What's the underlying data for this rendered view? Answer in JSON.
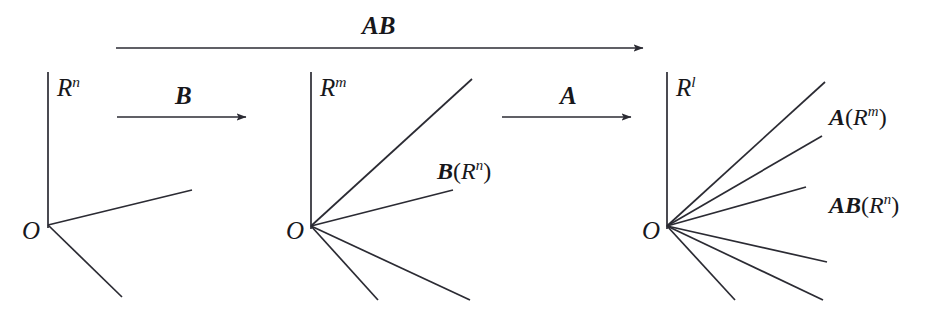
{
  "figure": {
    "background_color": "#ffffff",
    "stroke_color": "#2b2b33",
    "text_color": "#17171b"
  },
  "top_arrow": {
    "label_text": "AB",
    "label_parts": {
      "bold_italic": "AB"
    },
    "from_x": 116,
    "to_x": 645,
    "y": 48
  },
  "arrows": [
    {
      "name": "arrow-B",
      "label_text": "B",
      "label_parts": {
        "bold_italic": "B"
      },
      "from_x": 117,
      "to_x": 248,
      "y": 117
    },
    {
      "name": "arrow-A",
      "label_text": "A",
      "label_parts": {
        "bold_italic": "A"
      },
      "from_x": 502,
      "to_x": 633,
      "y": 117
    }
  ],
  "panels": [
    {
      "name": "panel-rn",
      "space_label": "R",
      "space_superscript": "n",
      "space_label_text": "Rn",
      "origin_label": "O",
      "origin_x": 48,
      "origin_y": 225,
      "axis_top_y": 72,
      "ray_count": 2,
      "rays": [
        {
          "name": "ray-rn-1",
          "x2": 192,
          "y2": 190
        },
        {
          "name": "ray-rn-2",
          "x2": 122,
          "y2": 297
        }
      ]
    },
    {
      "name": "panel-rm",
      "space_label": "R",
      "space_superscript": "m",
      "space_label_text": "Rm",
      "origin_label": "O",
      "origin_x": 311,
      "origin_y": 226,
      "axis_top_y": 72,
      "ray_count": 4,
      "image_label_text": "B(Rn)",
      "image_label_parts": {
        "bold_italic": "B",
        "open": "(",
        "italic": "R",
        "sup": "n",
        "close": ")"
      },
      "rays": [
        {
          "name": "ray-rm-1",
          "x2": 472,
          "y2": 79
        },
        {
          "name": "ray-rm-2",
          "x2": 453,
          "y2": 190
        },
        {
          "name": "ray-rm-3",
          "x2": 378,
          "y2": 300
        },
        {
          "name": "ray-rm-4",
          "x2": 470,
          "y2": 300
        }
      ]
    },
    {
      "name": "panel-rl",
      "space_label": "R",
      "space_superscript": "l",
      "space_label_text": "Rl",
      "origin_label": "O",
      "origin_x": 667,
      "origin_y": 226,
      "axis_top_y": 72,
      "ray_count": 5,
      "image_label_a_text": "A(Rm)",
      "image_label_a_parts": {
        "bold_italic": "A",
        "open": "(",
        "italic": "R",
        "sup": "m",
        "close": ")"
      },
      "image_label_ab_text": "AB(Rn)",
      "image_label_ab_parts": {
        "bold_italic": "AB",
        "open": "(",
        "italic": "R",
        "sup": "n",
        "close": ")"
      },
      "rays": [
        {
          "name": "ray-rl-1",
          "x2": 825,
          "y2": 82
        },
        {
          "name": "ray-rl-2",
          "x2": 822,
          "y2": 136
        },
        {
          "name": "ray-rl-3",
          "x2": 806,
          "y2": 187
        },
        {
          "name": "ray-rl-4",
          "x2": 827,
          "y2": 262
        },
        {
          "name": "ray-rl-5",
          "x2": 823,
          "y2": 300
        },
        {
          "name": "ray-rl-6",
          "x2": 735,
          "y2": 300
        }
      ]
    }
  ]
}
